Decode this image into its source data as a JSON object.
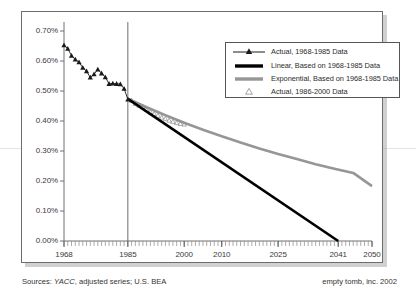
{
  "chart_data": {
    "type": "line",
    "title": "",
    "subtitle": "",
    "xlabel": "",
    "ylabel": "",
    "xlim": [
      1968,
      2050
    ],
    "ylim": [
      0.0,
      0.7
    ],
    "grid": false,
    "y_ticks": [
      "0.00%",
      "0.10%",
      "0.20%",
      "0.30%",
      "0.40%",
      "0.50%",
      "0.60%",
      "0.70%"
    ],
    "y_tick_values": [
      0.0,
      0.1,
      0.2,
      0.3,
      0.4,
      0.5,
      0.6,
      0.7
    ],
    "x_ticks": [
      "1968",
      "1985",
      "2000",
      "2010",
      "2025",
      "2041",
      "2050"
    ],
    "x_tick_values": [
      1968,
      1985,
      2000,
      2010,
      2025,
      2041,
      2050
    ],
    "legend_position": "upper right",
    "reference_line_year": 1985,
    "series": [
      {
        "name": "Actual, 1968-1985 Data",
        "style": "line-marker",
        "marker": "filled-triangle",
        "color": "#1a1a1a",
        "x": [
          1968,
          1969,
          1970,
          1971,
          1972,
          1973,
          1974,
          1975,
          1976,
          1977,
          1978,
          1979,
          1980,
          1981,
          1982,
          1983,
          1984,
          1985
        ],
        "values": [
          0.653,
          0.641,
          0.618,
          0.605,
          0.596,
          0.578,
          0.566,
          0.545,
          0.556,
          0.572,
          0.559,
          0.546,
          0.524,
          0.525,
          0.524,
          0.523,
          0.508,
          0.472
        ]
      },
      {
        "name": "Linear, Based on 1968-1985 Data",
        "style": "line",
        "color": "#000000",
        "x": [
          1985,
          2041
        ],
        "values": [
          0.474,
          0.0
        ]
      },
      {
        "name": "Exponential, Based on 1968-1985 Data",
        "style": "line",
        "color": "#969696",
        "x": [
          1985,
          1990,
          1995,
          2000,
          2005,
          2010,
          2015,
          2020,
          2025,
          2030,
          2035,
          2040,
          2045,
          2050
        ],
        "values": [
          0.474,
          0.446,
          0.419,
          0.394,
          0.371,
          0.349,
          0.328,
          0.308,
          0.29,
          0.273,
          0.256,
          0.241,
          0.227,
          0.183
        ]
      },
      {
        "name": "Actual, 1986-2000 Data",
        "style": "marker",
        "marker": "open-triangle",
        "color": "#8c8c8c",
        "x": [
          1986,
          1987,
          1988,
          1989,
          1990,
          1991,
          1992,
          1993,
          1994,
          1995,
          1996,
          1997,
          1998,
          1999,
          2000
        ],
        "values": [
          0.468,
          0.458,
          0.452,
          0.447,
          0.438,
          0.43,
          0.424,
          0.418,
          0.412,
          0.407,
          0.402,
          0.398,
          0.394,
          0.391,
          0.389
        ]
      }
    ]
  },
  "legend": {
    "items": [
      {
        "label": "Actual, 1968-1985 Data",
        "key": "line-with-filled-triangle"
      },
      {
        "label": "Linear, Based on 1968-1985 Data",
        "key": "thick-black-line"
      },
      {
        "label": "Exponential, Based on 1968-1985 Data",
        "key": "thick-gray-line"
      },
      {
        "label": "Actual, 1986-2000 Data",
        "key": "open-triangle"
      }
    ]
  },
  "footer": {
    "sources_prefix": "Sources: ",
    "sources_italic": "YACC",
    "sources_suffix": ", adjusted series; U.S. BEA",
    "publisher": "empty tomb, inc.  2002"
  },
  "colors": {
    "linear": "#000000",
    "exponential": "#969696",
    "actual_early": "#1a1a1a",
    "actual_late": "#8c8c8c",
    "frame": "#6d6d6d",
    "text": "#333333"
  }
}
